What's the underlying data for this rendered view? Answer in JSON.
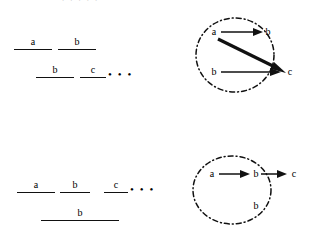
{
  "figure": {
    "clipped_caption": ". . . . .",
    "background_color": "#ffffff",
    "ink_color": "#111111"
  },
  "panels": {
    "top_left": {
      "name": "interval-diagram-top",
      "rows": [
        {
          "segments": [
            {
              "label": "a",
              "x": 14,
              "width": 38
            },
            {
              "label": "b",
              "x": 58,
              "width": 38
            }
          ],
          "y": 32,
          "ellipsis": null
        },
        {
          "segments": [
            {
              "label": "b",
              "x": 36,
              "width": 38
            },
            {
              "label": "c",
              "x": 80,
              "width": 26
            }
          ],
          "y": 60,
          "ellipsis": "• • •"
        }
      ]
    },
    "top_right": {
      "name": "graph-diagram-top",
      "circle": {
        "cx": 235,
        "cy": 55,
        "rx": 39,
        "ry": 37
      },
      "nodes": [
        {
          "label": "a",
          "x": 213,
          "y": 30
        },
        {
          "label": "b",
          "x": 266,
          "y": 30
        },
        {
          "label": "c",
          "x": 285,
          "y": 70
        },
        {
          "label": "b",
          "x": 212,
          "y": 70
        }
      ],
      "edges": [
        {
          "from": "a",
          "to": "b",
          "weight": "thin"
        },
        {
          "from": "a",
          "to": "c",
          "weight": "thick"
        },
        {
          "from": "b",
          "to": "c",
          "weight": "thin"
        }
      ]
    },
    "bottom_left": {
      "name": "interval-diagram-bottom",
      "rows": [
        {
          "segments": [
            {
              "label": "a",
              "x": 17,
              "width": 38
            },
            {
              "label": "b",
              "x": 60,
              "width": 30
            },
            {
              "label": "c",
              "x": 104,
              "width": 24
            }
          ],
          "y": 175,
          "ellipsis": "• • •"
        },
        {
          "segments": [
            {
              "label": "b",
              "x": 41,
              "width": 78
            }
          ],
          "y": 203,
          "ellipsis": null
        }
      ]
    },
    "bottom_right": {
      "name": "graph-diagram-bottom",
      "circle": {
        "cx": 232,
        "cy": 190,
        "rx": 39,
        "ry": 34
      },
      "nodes": [
        {
          "label": "a",
          "x": 210,
          "y": 174
        },
        {
          "label": "b",
          "x": 253,
          "y": 174
        },
        {
          "label": "c",
          "x": 291,
          "y": 174
        },
        {
          "label": "b",
          "x": 253,
          "y": 206
        }
      ],
      "edges": [
        {
          "from": "a",
          "to": "b",
          "weight": "thin"
        },
        {
          "from": "b",
          "to": "c",
          "weight": "thin"
        }
      ]
    }
  }
}
